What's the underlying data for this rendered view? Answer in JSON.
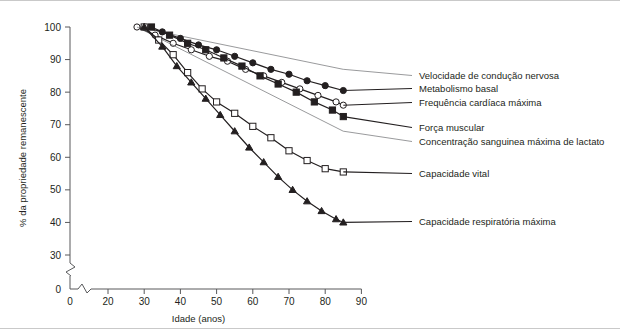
{
  "chart_data": {
    "type": "line",
    "title": "",
    "xlabel": "Idade (anos)",
    "ylabel": "% da propriedade remanescente",
    "xlim": [
      0,
      90
    ],
    "ylim": [
      0,
      100
    ],
    "xticks": [
      0,
      20,
      30,
      40,
      50,
      60,
      70,
      80,
      90
    ],
    "yticks": [
      0,
      30,
      40,
      50,
      60,
      70,
      80,
      90,
      100
    ],
    "axis_break_x": true,
    "axis_break_y": true,
    "grid": false,
    "legend_position": "right",
    "series": [
      {
        "name": "Velocidade de condução nervosa",
        "marker": "none",
        "marker_fill": "none",
        "x": [
          28,
          85
        ],
        "values": [
          100,
          87
        ]
      },
      {
        "name": "Metabolismo basal",
        "marker": "circle",
        "marker_fill": "filled",
        "x": [
          30,
          35,
          40,
          45,
          50,
          55,
          60,
          65,
          70,
          75,
          80,
          85
        ],
        "values": [
          100,
          98.5,
          96.5,
          94.5,
          93,
          91,
          89,
          87,
          85.5,
          83.5,
          82,
          80.5
        ]
      },
      {
        "name": "Frequência cardíaca máxima",
        "marker": "circle",
        "marker_fill": "open",
        "x": [
          28,
          33,
          38,
          43,
          48,
          53,
          58,
          63,
          68,
          73,
          78,
          83,
          85
        ],
        "values": [
          100,
          97.5,
          95,
          93,
          91,
          89.5,
          87,
          85,
          83,
          81,
          79,
          77,
          76
        ]
      },
      {
        "name": "Força muscular",
        "marker": "square",
        "marker_fill": "filled",
        "x": [
          32,
          37,
          42,
          47,
          52,
          57,
          62,
          67,
          72,
          77,
          82,
          85
        ],
        "values": [
          100,
          97.5,
          95,
          93,
          90.5,
          88,
          85,
          82.5,
          80,
          77,
          74.5,
          72.5
        ]
      },
      {
        "name": "Concentração sanguinea máxima de lactato",
        "marker": "none",
        "marker_fill": "none",
        "x": [
          28,
          85
        ],
        "values": [
          100,
          68
        ]
      },
      {
        "name": "Capacidade vital",
        "marker": "square",
        "marker_fill": "open",
        "x": [
          30,
          34,
          38,
          42,
          46,
          50,
          55,
          60,
          65,
          70,
          75,
          80,
          85
        ],
        "values": [
          100,
          96,
          91.5,
          86,
          81,
          77,
          73.5,
          69.5,
          66,
          62,
          59,
          56.5,
          55.5
        ]
      },
      {
        "name": "Capacidade respiratória máxima",
        "marker": "triangle",
        "marker_fill": "filled",
        "x": [
          30,
          35,
          39,
          43,
          47,
          51,
          55,
          59,
          63,
          67,
          71,
          75,
          79,
          83,
          85
        ],
        "values": [
          100,
          94,
          88,
          83,
          78,
          73,
          68,
          63,
          58.5,
          54,
          50,
          46.5,
          43.5,
          41,
          40
        ]
      }
    ],
    "legend_entries": [
      {
        "label": "Velocidade de condução nervosa",
        "marker": "none"
      },
      {
        "label": "Metabolismo basal",
        "marker": "circle-filled"
      },
      {
        "label": "Frequência cardíaca máxima",
        "marker": "circle-open"
      },
      {
        "label": "Força muscular",
        "marker": "square-filled"
      },
      {
        "label": "Concentração sanguinea máxima de lactato",
        "marker": "none"
      },
      {
        "label": "Capacidade vital",
        "marker": "square-open"
      },
      {
        "label": "Capacidade respiratória máxima",
        "marker": "triangle-filled"
      }
    ],
    "colors": {
      "line": "#231f20",
      "thin_line": "#6d6e71",
      "axis": "#58595b",
      "text": "#231f20",
      "border": "#c9c9c9",
      "background": "#ffffff"
    }
  }
}
